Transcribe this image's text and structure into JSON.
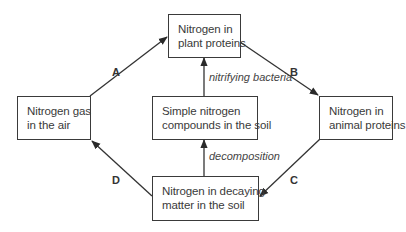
{
  "diagram": {
    "nodes": {
      "plant": {
        "line1": "Nitrogen in",
        "line2": "plant proteins"
      },
      "air": {
        "line1": "Nitrogen gas",
        "line2": "in the air"
      },
      "simple": {
        "line1": "Simple nitrogen",
        "line2": "compounds in the soil"
      },
      "animal": {
        "line1": "Nitrogen in",
        "line2": "animal proteins"
      },
      "decaying": {
        "line1": "Nitrogen in decaying",
        "line2": "matter in the soil"
      }
    },
    "edges": {
      "A": {
        "label": "A",
        "from": "air",
        "to": "plant"
      },
      "B": {
        "label": "B",
        "from": "plant",
        "to": "animal"
      },
      "C": {
        "label": "C",
        "from": "animal",
        "to": "decaying"
      },
      "D": {
        "label": "D",
        "from": "decaying",
        "to": "air"
      },
      "nitrifying": {
        "label": "nitrifying bacteria",
        "from": "simple",
        "to": "plant"
      },
      "decomposition": {
        "label": "decomposition",
        "from": "decaying",
        "to": "simple"
      }
    },
    "colors": {
      "stroke": "#3a3a3a",
      "text": "#3a3a3a",
      "background": "#ffffff"
    }
  }
}
